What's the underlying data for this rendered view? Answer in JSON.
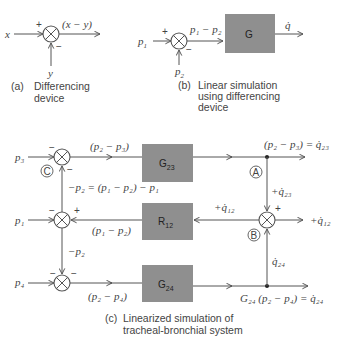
{
  "panel_a": {
    "input_x": "x",
    "input_y": "y",
    "plus": "+",
    "minus": "−",
    "output": "(x − y)",
    "caption_tag": "(a)",
    "caption_line1": "Differencing",
    "caption_line2": "device"
  },
  "panel_b": {
    "input_p1": "p",
    "input_p1_sub": "1",
    "input_p2": "p",
    "input_p2_sub": "2",
    "plus": "+",
    "minus": "−",
    "diff_label": "p₁ − p₂",
    "block": "G",
    "output": "q̇",
    "caption_tag": "(b)",
    "caption_line1": "Linear simulation",
    "caption_line2": "using differencing",
    "caption_line3": "device"
  },
  "panel_c": {
    "input_p3": "p₃",
    "input_p1": "p₁",
    "input_p4": "p₄",
    "top_diff": "(p₂ − p₃)",
    "mid_eq": "−p₂ = (p₁ − p₂) − p₁",
    "mid_diff": "(p₁ − p₂)",
    "neg_p2": "−p₂",
    "bot_diff": "(p₂ − p₄)",
    "block_g23": "G",
    "block_g23_sub": "23",
    "block_r12": "R",
    "block_r12_sub": "12",
    "block_g24": "G",
    "block_g24_sub": "24",
    "out_top": "(p₂ − p₃) = q̇₂₃",
    "plus_q23": "+q̇₂₃",
    "plus_q12_left": "+q̇₁₂",
    "plus_q12_right": "+q̇₁₂",
    "q24": "q̇₂₄",
    "out_bot": "G₂₄ (p₂ − p₄) = q̇₂₄",
    "node_a": "A",
    "node_b": "B",
    "node_c": "C",
    "plus": "+",
    "minus": "−",
    "caption_tag": "(c)",
    "caption_line1": "Linearized simulation of",
    "caption_line2": "tracheal-bronchial system"
  }
}
